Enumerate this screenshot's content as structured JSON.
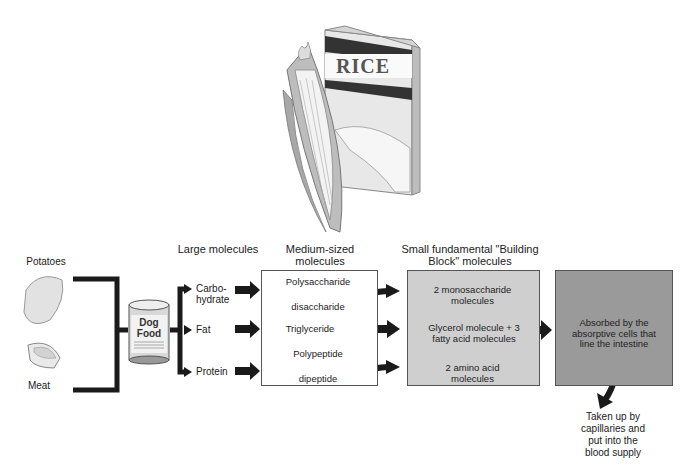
{
  "illustrations": {
    "rice_box_label": "RICE",
    "corn": "corn-cob",
    "dog_food_can": "Dog Food"
  },
  "sources": [
    {
      "label": "Potatoes"
    },
    {
      "label": "Meat"
    }
  ],
  "can": {
    "line1": "Dog",
    "line2": "Food"
  },
  "headers": {
    "large": "Large molecules",
    "medium": "Medium-sized molecules",
    "small": "Small fundamental \"Building Block\" molecules"
  },
  "large_molecules": [
    "Carbo-hydrate",
    "Fat",
    "Protein"
  ],
  "large_molecules_display": {
    "carb_line1": "Carbo-",
    "carb_line2": "hydrate",
    "fat": "Fat",
    "protein": "Protein"
  },
  "medium_molecules": {
    "carb_from": "Polysaccharide",
    "carb_to": "disaccharide",
    "fat": "Triglyceride",
    "protein_from": "Polypeptide",
    "protein_to": "dipeptide"
  },
  "small_molecules": {
    "carb": "2 monosaccharide molecules",
    "fat": "Glycerol molecule + 3 fatty acid molecules",
    "protein": "2 amino acid molecules"
  },
  "absorption": {
    "box_text": "Absorbed by the absorptive cells that line the intestine",
    "final_text": "Taken up by capillaries and put into the blood supply"
  },
  "colors": {
    "medium_box": "#ffffff",
    "small_box": "#cfcfcf",
    "absorb_box": "#9a9a9a",
    "arrow": "#1a1a1a"
  }
}
